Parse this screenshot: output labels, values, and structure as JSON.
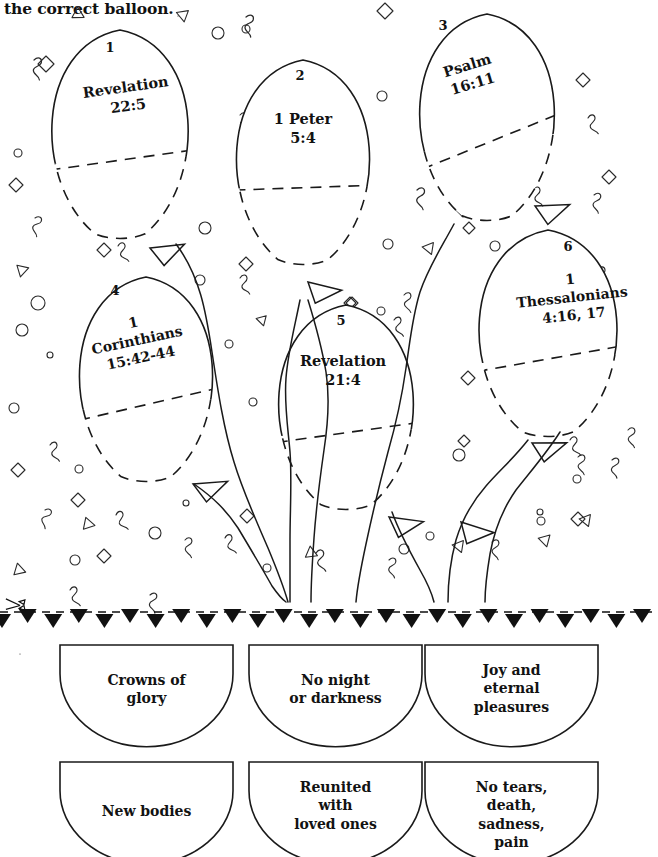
{
  "worksheet": {
    "instruction": "the correct balloon.",
    "cut_line_icon": "scissors-icon"
  },
  "balloons": [
    {
      "number": "1",
      "reference": "Revelation\n22:5",
      "rotation": -8,
      "num_x": 110,
      "num_y": 40,
      "label_x": 52,
      "label_y": 78,
      "label_w": 150,
      "font_size": 14.5,
      "cx": 120,
      "cy": 135,
      "rx": 84,
      "ry": 105,
      "split_angle": -8
    },
    {
      "number": "2",
      "reference": "1 Peter\n5:4",
      "rotation": 0,
      "num_x": 300,
      "num_y": 68,
      "label_x": 238,
      "label_y": 110,
      "label_w": 130,
      "font_size": 14.5,
      "cx": 303,
      "cy": 163,
      "rx": 82,
      "ry": 103,
      "split_angle": -2
    },
    {
      "number": "3",
      "reference": "Psalm\n16:11",
      "rotation": -17,
      "num_x": 443,
      "num_y": 18,
      "label_x": 410,
      "label_y": 56,
      "label_w": 120,
      "font_size": 14.5,
      "cx": 487,
      "cy": 118,
      "rx": 83,
      "ry": 104,
      "split_angle": -22
    },
    {
      "number": "4",
      "reference": "1\nCorinthians\n15:42-44",
      "rotation": -12,
      "num_x": 115,
      "num_y": 283,
      "label_x": 62,
      "label_y": 313,
      "label_w": 150,
      "font_size": 14.0,
      "cx": 146,
      "cy": 380,
      "rx": 82,
      "ry": 103,
      "split_angle": -13
    },
    {
      "number": "5",
      "reference": "Revelation\n21:4",
      "rotation": 0,
      "num_x": 341,
      "num_y": 313,
      "label_x": 278,
      "label_y": 352,
      "label_w": 130,
      "font_size": 14.5,
      "cx": 346,
      "cy": 408,
      "rx": 83,
      "ry": 103,
      "split_angle": -8
    },
    {
      "number": "6",
      "reference": "1\nThessalonians\n4:16, 17",
      "rotation": -6,
      "num_x": 568,
      "num_y": 239,
      "label_x": 492,
      "label_y": 270,
      "label_w": 160,
      "font_size": 14.0,
      "cx": 548,
      "cy": 334,
      "rx": 85,
      "ry": 104,
      "split_angle": -10
    }
  ],
  "answer_cards": [
    {
      "text": "Crowns of\nglory",
      "x": 60,
      "y": 645
    },
    {
      "text": "No night\nor darkness",
      "x": 249,
      "y": 645
    },
    {
      "text": "Joy and\neternal\npleasures",
      "x": 425,
      "y": 645
    },
    {
      "text": "New bodies",
      "x": 60,
      "y": 762
    },
    {
      "text": "Reunited\nwith\nloved ones",
      "x": 249,
      "y": 762
    },
    {
      "text": "No tears,\ndeath,\nsadness,\npain",
      "x": 425,
      "y": 762
    }
  ],
  "colors": {
    "ink": "#111111",
    "paper": "#ffffff",
    "line": "#1a1a1a"
  }
}
